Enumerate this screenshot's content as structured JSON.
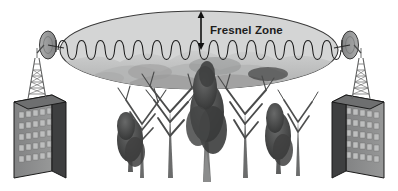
{
  "diagram": {
    "background_color": "#ffffff",
    "width": 398,
    "height": 191
  },
  "annotation": {
    "label": "Fresnel Zone",
    "label_color": "#1d1d1d",
    "arrow_name": "fresnel-zone-height-arrow",
    "arrow_color": "#111111",
    "arrow_top_y": 12,
    "arrow_bottom_y": 49
  },
  "fresnel_zone": {
    "name": "fresnel-zone-ellipse",
    "center_x": 199,
    "center_y": 50,
    "radius_x": 139,
    "radius_y": 39,
    "fill_color": "#d2d3d3",
    "stroke_color": "#3a3a3a",
    "stroke_width": 1.1
  },
  "signal_wave": {
    "name": "signal-wave",
    "stroke_color": "#1a1a1a",
    "baseline_y": 50,
    "start_x": 58,
    "end_x": 341,
    "loop_count": 30,
    "amplitude": 6
  },
  "sites": [
    {
      "id": "left",
      "name": "left-site",
      "building": {
        "name": "left-building",
        "front_color": "#8d8e8e",
        "side_color": "#3e3f40",
        "top_color": "#6e6f70",
        "outline_color": "#1b1b1b",
        "window_color": "#bdbebe",
        "window_rows": 5,
        "window_cols": 5,
        "x": 14,
        "y": 95,
        "width": 52,
        "height": 83
      },
      "tower": {
        "name": "left-lattice-tower",
        "color": "#6f7071",
        "base_x": 37,
        "base_y": 95,
        "top_y": 58,
        "half_width_base": 9,
        "half_width_top": 2
      },
      "dish": {
        "name": "left-dish-antenna",
        "center_x": 51,
        "center_y": 47,
        "radius_x": 8,
        "radius_y": 14,
        "fill_color": "#9b9c9c",
        "stroke_color": "#2a2a2a",
        "faces": "right"
      }
    },
    {
      "id": "right",
      "name": "right-site",
      "building": {
        "name": "right-building",
        "front_color": "#8d8e8e",
        "side_color": "#3e3f40",
        "top_color": "#6e6f70",
        "outline_color": "#1b1b1b",
        "window_color": "#bdbebe",
        "window_rows": 5,
        "window_cols": 5,
        "x": 332,
        "y": 95,
        "width": 52,
        "height": 83
      },
      "tower": {
        "name": "right-lattice-tower",
        "color": "#6f7071",
        "base_x": 361,
        "base_y": 95,
        "top_y": 58,
        "half_width_base": 9,
        "half_width_top": 2
      },
      "dish": {
        "name": "right-dish-antenna",
        "center_x": 348,
        "center_y": 47,
        "radius_x": 8,
        "radius_y": 14,
        "fill_color": "#9b9c9c",
        "stroke_color": "#2a2a2a",
        "faces": "left"
      }
    }
  ],
  "foliage": {
    "name": "tree-obstruction-group",
    "description": "Grayscale photographic stand of trees blocking the link path",
    "canopy_color": "#7e7f7f",
    "canopy_dark_color": "#4b4c4c",
    "trunk_color": "#6b6c6c",
    "haze_color": "#c6c7c7",
    "trees": [
      {
        "name": "tree-far-left",
        "x": 120,
        "canopy_y": 95,
        "scale": 0.75,
        "type": "bare-branch"
      },
      {
        "name": "tree-left-conifer",
        "x": 132,
        "canopy_y": 112,
        "scale": 0.9,
        "type": "conifer"
      },
      {
        "name": "tree-left-mid",
        "x": 155,
        "canopy_y": 88,
        "scale": 1.0,
        "type": "bare-branch"
      },
      {
        "name": "tree-center-conifer",
        "x": 205,
        "canopy_y": 70,
        "scale": 1.25,
        "type": "conifer"
      },
      {
        "name": "tree-right-mid",
        "x": 245,
        "canopy_y": 90,
        "scale": 1.0,
        "type": "bare-branch"
      },
      {
        "name": "tree-right-conifer",
        "x": 275,
        "canopy_y": 100,
        "scale": 0.95,
        "type": "conifer"
      },
      {
        "name": "tree-far-right",
        "x": 295,
        "canopy_y": 95,
        "scale": 0.8,
        "type": "bare-branch"
      }
    ]
  }
}
